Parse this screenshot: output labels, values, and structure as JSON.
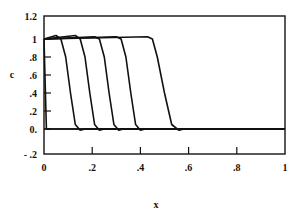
{
  "chart_data": {
    "type": "line",
    "title": "",
    "xlabel": "x",
    "ylabel": "c",
    "xlim": [
      0,
      1
    ],
    "ylim": [
      -0.2,
      1.2
    ],
    "grid": false,
    "legend": null,
    "x_ticks": [
      "0",
      ".2",
      ".4",
      ".6",
      ".8",
      "1"
    ],
    "y_ticks": [
      "1.2",
      "1",
      ".8",
      ".6",
      ".4",
      ".2",
      "0.",
      "- .2"
    ],
    "series": [
      {
        "name": "profile-1",
        "front_x": 0.0,
        "points": [
          [
            0,
            1.0
          ],
          [
            0.005,
            0.5
          ],
          [
            0.01,
            0.0
          ],
          [
            1,
            0.0
          ]
        ]
      },
      {
        "name": "profile-2",
        "front_x": 0.11,
        "points": [
          [
            0,
            1.0
          ],
          [
            0.05,
            1.03
          ],
          [
            0.07,
            1.0
          ],
          [
            0.09,
            0.8
          ],
          [
            0.11,
            0.4
          ],
          [
            0.13,
            0.05
          ],
          [
            0.15,
            -0.01
          ],
          [
            0.17,
            0.0
          ],
          [
            1,
            0.0
          ]
        ]
      },
      {
        "name": "profile-3",
        "front_x": 0.19,
        "points": [
          [
            0,
            1.0
          ],
          [
            0.13,
            1.03
          ],
          [
            0.15,
            1.0
          ],
          [
            0.17,
            0.8
          ],
          [
            0.19,
            0.4
          ],
          [
            0.21,
            0.05
          ],
          [
            0.23,
            -0.01
          ],
          [
            0.25,
            0.0
          ],
          [
            1,
            0.0
          ]
        ]
      },
      {
        "name": "profile-4",
        "front_x": 0.27,
        "points": [
          [
            0,
            1.0
          ],
          [
            0.21,
            1.02
          ],
          [
            0.23,
            1.0
          ],
          [
            0.25,
            0.8
          ],
          [
            0.27,
            0.4
          ],
          [
            0.29,
            0.05
          ],
          [
            0.31,
            -0.01
          ],
          [
            0.33,
            0.0
          ],
          [
            1,
            0.0
          ]
        ]
      },
      {
        "name": "profile-5",
        "front_x": 0.36,
        "points": [
          [
            0,
            1.0
          ],
          [
            0.3,
            1.02
          ],
          [
            0.32,
            1.0
          ],
          [
            0.34,
            0.8
          ],
          [
            0.36,
            0.4
          ],
          [
            0.38,
            0.05
          ],
          [
            0.4,
            -0.01
          ],
          [
            0.42,
            0.0
          ],
          [
            1,
            0.0
          ]
        ]
      },
      {
        "name": "profile-6",
        "front_x": 0.49,
        "points": [
          [
            0,
            1.0
          ],
          [
            0.43,
            1.02
          ],
          [
            0.45,
            1.0
          ],
          [
            0.47,
            0.8
          ],
          [
            0.5,
            0.4
          ],
          [
            0.53,
            0.05
          ],
          [
            0.56,
            -0.01
          ],
          [
            0.58,
            0.0
          ],
          [
            1,
            0.0
          ]
        ]
      }
    ]
  }
}
